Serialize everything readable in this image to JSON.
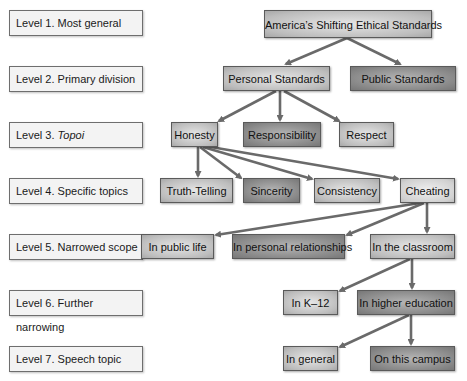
{
  "levels": [
    {
      "prefix": "Level 1. ",
      "name": "Most general"
    },
    {
      "prefix": "Level 2. ",
      "name": "Primary division"
    },
    {
      "prefix": "Level 3. ",
      "name": "Topoi"
    },
    {
      "prefix": "Level 4. ",
      "name": "Specific topics"
    },
    {
      "prefix": "Level 5. ",
      "name": "Narrowed scope"
    },
    {
      "prefix": "Level 6. ",
      "name": "Further narrowing"
    },
    {
      "prefix": "Level 7. ",
      "name": "Speech topic"
    }
  ],
  "nodes": {
    "root": "America’s Shifting Ethical Standards",
    "personal": "Personal Standards",
    "public": "Public Standards",
    "honesty": "Honesty",
    "responsibility": "Responsibility",
    "respect": "Respect",
    "truth_telling": "Truth-Telling",
    "sincerity": "Sincerity",
    "consistency": "Consistency",
    "cheating": "Cheating",
    "public_life": "In public life",
    "personal_relationships": "In personal relationships",
    "classroom": "In the classroom",
    "k12": "In K–12",
    "higher_ed": "In higher education",
    "in_general": "In general",
    "this_campus": "On this campus"
  },
  "colors": {
    "arrow": "#6a6a6a",
    "light_node": "#c8c8c8",
    "dark_node": "#8c8c8c",
    "level_box": "#f3f3f3"
  }
}
